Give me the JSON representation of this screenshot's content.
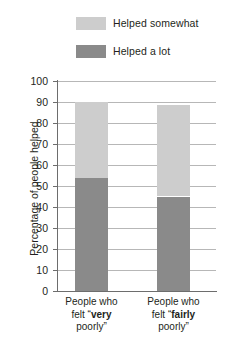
{
  "chart_data": {
    "type": "bar",
    "subtype": "stacked",
    "title": "",
    "xlabel": "",
    "ylabel": "Percentage of people helped",
    "ylim": [
      0,
      100
    ],
    "ytick_step": 10,
    "yticks": [
      "100",
      "90",
      "80",
      "70",
      "60",
      "50",
      "40",
      "30",
      "20",
      "10",
      "0"
    ],
    "grid": true,
    "legend_position": "top-center",
    "categories": [
      {
        "line1": "People who",
        "line2_prefix": "felt “",
        "line2_bold": "very",
        "line3": "poorly”"
      },
      {
        "line1": "People who",
        "line2_prefix": "felt “",
        "line2_bold": "fairly",
        "line3": "poorly”"
      }
    ],
    "series": [
      {
        "name": "Helped a lot",
        "color": "#8a8a8a",
        "values": [
          54,
          45
        ]
      },
      {
        "name": "Helped somewhat",
        "color": "#cdcdcd",
        "values": [
          36,
          43.5
        ]
      }
    ],
    "totals": [
      90,
      88.5
    ]
  },
  "legend": {
    "items": [
      {
        "label": "Helped somewhat",
        "color": "#cdcdcd"
      },
      {
        "label": "Helped a lot",
        "color": "#8a8a8a"
      }
    ]
  },
  "axis": {
    "y_title": "Percentage of people helped"
  },
  "colors": {
    "helped_somewhat": "#cdcdcd",
    "helped_a_lot": "#8a8a8a",
    "gridline": "#b7b7b7",
    "axis": "#6d6d6d",
    "text": "#231f20",
    "background": "#ffffff"
  }
}
